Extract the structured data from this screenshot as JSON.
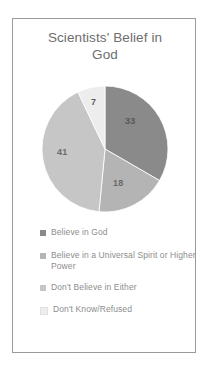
{
  "chart_data": {
    "type": "pie",
    "title": "Scientists' Belief in God",
    "title_line1": "Scientists' Belief in",
    "title_line2": "God",
    "categories": [
      "Believe in God",
      "Believe in a Universal Spirit or Higher Power",
      "Don't Believe in Either",
      "Don't Know/Refused"
    ],
    "values": [
      33,
      18,
      41,
      7
    ],
    "labels": [
      "33",
      "18",
      "41",
      "7"
    ],
    "colors": [
      "#8a8a8a",
      "#b4b4b4",
      "#c6c6c6",
      "#ededed"
    ],
    "legend_position": "bottom",
    "grid": false,
    "xlabel": "",
    "ylabel": ""
  },
  "legend": {
    "items": [
      {
        "label": "Believe in God",
        "color": "#8a8a8a"
      },
      {
        "label": "Believe in a Universal Spirit or Higher Power",
        "color": "#b4b4b4"
      },
      {
        "label": "Don't Believe in Either",
        "color": "#c6c6c6"
      },
      {
        "label": "Don't Know/Refused",
        "color": "#ededed"
      }
    ]
  },
  "frame": {
    "border_color": "#9a9a9a",
    "background": "#ffffff"
  }
}
